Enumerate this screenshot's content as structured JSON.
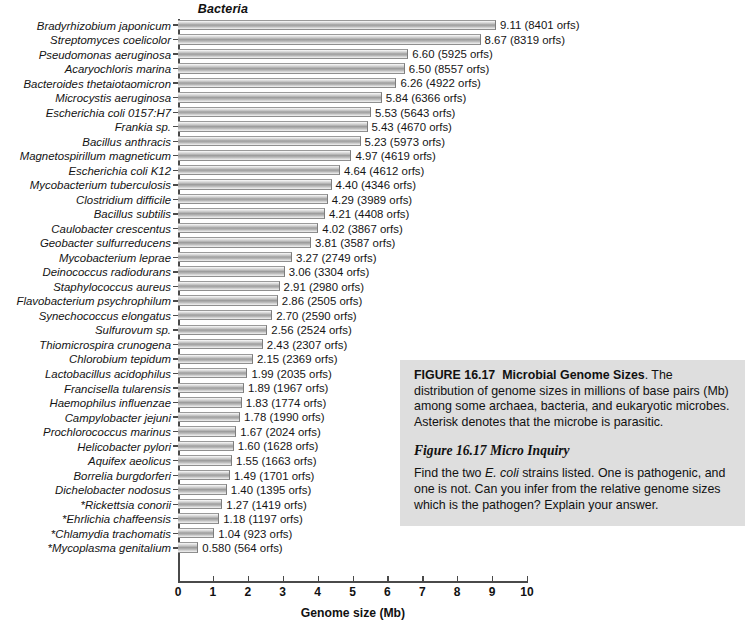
{
  "chart": {
    "group_title": "Bacteria",
    "x_axis_title": "Genome size (Mb)",
    "x_ticks": [
      "0",
      "1",
      "2",
      "3",
      "4",
      "5",
      "6",
      "7",
      "8",
      "9",
      "10"
    ]
  },
  "chart_data": {
    "type": "bar",
    "title": "Bacteria",
    "xlabel": "Genome size (Mb)",
    "ylabel": "",
    "xlim": [
      0,
      10
    ],
    "grid": false,
    "orientation": "horizontal",
    "legend": "none",
    "units": "Mb (millions of base pairs)",
    "annotation": "Asterisk denotes that the microbe is parasitic.",
    "categories": [
      "Bradyrhizobium japonicum",
      "Streptomyces coelicolor",
      "Pseudomonas aeruginosa",
      "Acaryochloris marina",
      "Bacteroides thetaiotaomicron",
      "Microcystis aeruginosa",
      "Escherichia coli 0157:H7",
      "Frankia sp.",
      "Bacillus anthracis",
      "Magnetospirillum magneticum",
      "Escherichia coli K12",
      "Mycobacterium tuberculosis",
      "Clostridium difficile",
      "Bacillus subtilis",
      "Caulobacter crescentus",
      "Geobacter sulfurreducens",
      "Mycobacterium leprae",
      "Deinococcus radiodurans",
      "Staphylococcus aureus",
      "Flavobacterium psychrophilum",
      "Synechococcus elongatus",
      "Sulfurovum sp.",
      "Thiomicrospira crunogena",
      "Chlorobium tepidum",
      "Lactobacillus acidophilus",
      "Francisella tularensis",
      "Haemophilus influenzae",
      "Campylobacter jejuni",
      "Prochlorococcus marinus",
      "Helicobacter pylori",
      "Aquifex aeolicus",
      "Borrelia burgdorferi",
      "Dichelobacter nodosus",
      "*Rickettsia conorii",
      "*Ehrlichia chaffeensis",
      "*Chlamydia trachomatis",
      "*Mycoplasma genitalium"
    ],
    "values": [
      9.11,
      8.67,
      6.6,
      6.5,
      6.26,
      5.84,
      5.53,
      5.43,
      5.23,
      4.97,
      4.64,
      4.4,
      4.29,
      4.21,
      4.02,
      3.81,
      3.27,
      3.06,
      2.91,
      2.86,
      2.7,
      2.56,
      2.43,
      2.15,
      1.99,
      1.89,
      1.83,
      1.78,
      1.67,
      1.6,
      1.55,
      1.49,
      1.4,
      1.27,
      1.18,
      1.04,
      0.58
    ],
    "orfs": [
      8401,
      8319,
      5925,
      8557,
      4922,
      6366,
      5643,
      4670,
      5973,
      4619,
      4612,
      4346,
      3989,
      4408,
      3867,
      3587,
      2749,
      3304,
      2980,
      2505,
      2590,
      2524,
      2307,
      2369,
      2035,
      1967,
      1774,
      1990,
      2024,
      1628,
      1663,
      1701,
      1395,
      1419,
      1197,
      923,
      564
    ],
    "bar_labels": [
      "9.11 (8401 orfs)",
      "8.67 (8319 orfs)",
      "6.60 (5925 orfs)",
      "6.50 (8557 orfs)",
      "6.26 (4922 orfs)",
      "5.84 (6366 orfs)",
      "5.53 (5643 orfs)",
      "5.43 (4670 orfs)",
      "5.23 (5973 orfs)",
      "4.97 (4619 orfs)",
      "4.64 (4612 orfs)",
      "4.40 (4346 orfs)",
      "4.29 (3989 orfs)",
      "4.21 (4408 orfs)",
      "4.02 (3867 orfs)",
      "3.81 (3587 orfs)",
      "3.27 (2749 orfs)",
      "3.06 (3304 orfs)",
      "2.91 (2980 orfs)",
      "2.86 (2505 orfs)",
      "2.70 (2590 orfs)",
      "2.56 (2524 orfs)",
      "2.43 (2307 orfs)",
      "2.15 (2369 orfs)",
      "1.99 (2035 orfs)",
      "1.89 (1967 orfs)",
      "1.83 (1774 orfs)",
      "1.78 (1990 orfs)",
      "1.67 (2024 orfs)",
      "1.60 (1628 orfs)",
      "1.55 (1663 orfs)",
      "1.49 (1701 orfs)",
      "1.40 (1395 orfs)",
      "1.27 (1419 orfs)",
      "1.18 (1197 orfs)",
      "1.04 (923 orfs)",
      "0.580 (564 orfs)"
    ]
  },
  "caption": {
    "figure_label": "FIGURE 16.17",
    "figure_title": "Microbial Genome Sizes",
    "figure_text": ". The distribution of genome sizes in millions of base pairs (Mb) among some archaea, bacteria, and eukaryotic microbes. Asterisk denotes that the microbe is parasitic.",
    "inquiry_heading": "Figure 16.17 Micro Inquiry",
    "inquiry_text_1": "Find the two ",
    "inquiry_sci": "E. coli",
    "inquiry_text_2": " strains listed. One is pathogenic, and one is not. Can you infer from the relative genome sizes which is the pathogen? Explain your answer."
  }
}
